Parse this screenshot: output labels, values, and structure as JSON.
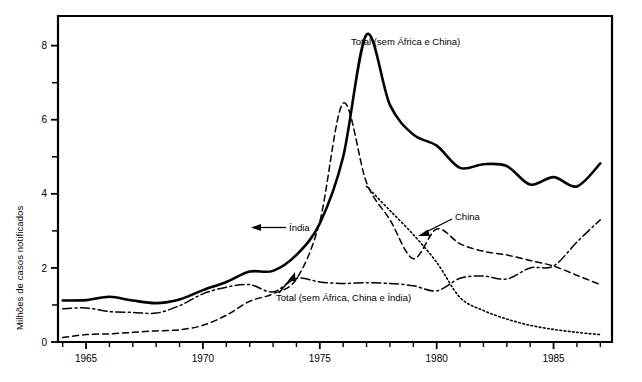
{
  "chart_data": {
    "type": "line",
    "title": "",
    "xlabel": "",
    "ylabel": "Milhões de casos notificados",
    "xlim": [
      1963.8,
      1987.5
    ],
    "ylim": [
      0,
      8.8
    ],
    "xticks_major": [
      1965,
      1970,
      1975,
      1980,
      1985
    ],
    "xtick_labels": [
      "1965",
      "1970",
      "1975",
      "1980",
      "1985"
    ],
    "xticks_all": [
      1964,
      1965,
      1966,
      1967,
      1968,
      1969,
      1970,
      1971,
      1972,
      1973,
      1974,
      1975,
      1976,
      1977,
      1978,
      1979,
      1980,
      1981,
      1982,
      1983,
      1984,
      1985,
      1986,
      1987
    ],
    "yticks_major": [
      0,
      2,
      4,
      6,
      8
    ],
    "ytick_labels": [
      "0",
      "2",
      "4",
      "6",
      "8"
    ],
    "yticks_minor": [
      1,
      3,
      5,
      7
    ],
    "grid": false,
    "legend": "inline-annotations",
    "series": [
      {
        "name": "Total (sem África e China)",
        "style": "solid",
        "color": "#000000",
        "width": 2.6,
        "x": [
          1964,
          1965,
          1966,
          1967,
          1968,
          1969,
          1970,
          1971,
          1972,
          1973,
          1974,
          1975,
          1976,
          1977,
          1978,
          1979,
          1980,
          1981,
          1982,
          1983,
          1984,
          1985,
          1986,
          1987
        ],
        "y": [
          1.12,
          1.13,
          1.22,
          1.12,
          1.05,
          1.15,
          1.4,
          1.62,
          1.9,
          1.92,
          2.35,
          3.2,
          5.0,
          8.3,
          6.4,
          5.6,
          5.3,
          4.7,
          4.8,
          4.75,
          4.25,
          4.45,
          4.2,
          4.82
        ]
      },
      {
        "name": "Índia",
        "style": "dashed",
        "color": "#000000",
        "width": 1.5,
        "x": [
          1964,
          1965,
          1966,
          1967,
          1968,
          1969,
          1970,
          1971,
          1972,
          1973,
          1974,
          1975,
          1976,
          1977,
          1978,
          1979,
          1980,
          1981,
          1982,
          1983,
          1984,
          1985,
          1986,
          1987
        ],
        "y": [
          0.12,
          0.2,
          0.22,
          0.26,
          0.3,
          0.33,
          0.45,
          0.72,
          1.1,
          1.3,
          1.7,
          3.25,
          6.45,
          4.3,
          3.3,
          2.25,
          3.05,
          2.65,
          2.45,
          2.35,
          2.2,
          2.05,
          1.8,
          1.55
        ]
      },
      {
        "name": "China",
        "style": "dotted",
        "color": "#000000",
        "width": 1.6,
        "x": [
          1977,
          1978,
          1979,
          1980,
          1981,
          1982,
          1983,
          1984,
          1985,
          1986,
          1987
        ],
        "y": [
          4.2,
          3.55,
          2.9,
          2.15,
          1.2,
          0.85,
          0.62,
          0.45,
          0.34,
          0.26,
          0.2
        ]
      },
      {
        "name": "Total (sem África, China e Índia)",
        "style": "dashdot",
        "color": "#000000",
        "width": 1.5,
        "x": [
          1964,
          1965,
          1966,
          1967,
          1968,
          1969,
          1970,
          1971,
          1972,
          1973,
          1974,
          1975,
          1976,
          1977,
          1978,
          1979,
          1980,
          1981,
          1982,
          1983,
          1984,
          1985,
          1986,
          1987
        ],
        "y": [
          0.9,
          0.92,
          0.82,
          0.8,
          0.78,
          0.98,
          1.3,
          1.48,
          1.55,
          1.35,
          1.72,
          1.62,
          1.58,
          1.6,
          1.58,
          1.52,
          1.38,
          1.72,
          1.78,
          1.7,
          2.0,
          2.05,
          2.7,
          3.3
        ]
      }
    ],
    "annotations": [
      {
        "name": "total-sem-africa-china",
        "text": "Total (sem África e China)",
        "x": 1987.2,
        "y": 8.35,
        "anchor": "label-right-of-peak"
      },
      {
        "name": "india",
        "text": "Índia",
        "x": 1974.2,
        "y": 2.82,
        "anchor": "arrow-left"
      },
      {
        "name": "china",
        "text": "China",
        "x": 1981.6,
        "y": 2.95,
        "anchor": "arrow-down-left"
      },
      {
        "name": "total-sem-africa-china-india",
        "text": "Total (sem África, China e Índia)",
        "x": 1974.6,
        "y": 1.0,
        "anchor": "arrow-up-left"
      }
    ]
  }
}
